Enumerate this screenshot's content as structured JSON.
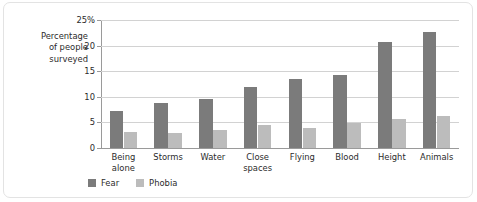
{
  "chart_data": {
    "type": "bar",
    "title": "",
    "subtitle": "",
    "xlabel": "",
    "ylabel": "Percentage\nof people\nsurveyed",
    "ylim": [
      0,
      25
    ],
    "yticks": [
      0,
      5,
      10,
      15,
      20,
      25
    ],
    "ytick_labels": [
      "0",
      "5",
      "10",
      "15",
      "20",
      "25%"
    ],
    "grid": true,
    "legend_position": "bottom-left",
    "categories": [
      "Being\nalone",
      "Storms",
      "Water",
      "Close\nspaces",
      "Flying",
      "Blood",
      "Height",
      "Animals"
    ],
    "series": [
      {
        "name": "Fear",
        "color": "#7b7b7b",
        "values": [
          7.2,
          8.8,
          9.5,
          12.0,
          13.4,
          14.2,
          20.7,
          22.7
        ]
      },
      {
        "name": "Phobia",
        "color": "#bcbcbc",
        "values": [
          3.2,
          3.0,
          3.6,
          4.5,
          3.9,
          4.9,
          5.7,
          6.2
        ]
      }
    ]
  },
  "colors": {
    "fear": "#7b7b7b",
    "phobia": "#bcbcbc",
    "axis": "#9a9a9a",
    "grid": "#d2d2d2",
    "text": "#2b2b2b",
    "frame": "#e3e3e3",
    "background": "#ffffff"
  }
}
